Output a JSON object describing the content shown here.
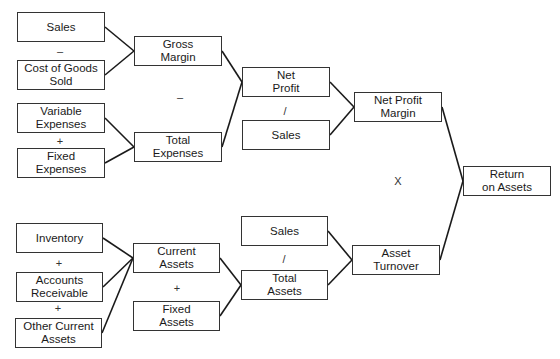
{
  "diagram": {
    "title": "",
    "nodes": {
      "sales_top": {
        "label": "Sales",
        "x": 17,
        "y": 12,
        "w": 88,
        "h": 30
      },
      "cogs": {
        "label": "Cost of Goods\nSold",
        "x": 17,
        "y": 60,
        "w": 88,
        "h": 30
      },
      "variable_expenses": {
        "label": "Variable\nExpenses",
        "x": 17,
        "y": 103,
        "w": 88,
        "h": 30
      },
      "fixed_expenses": {
        "label": "Fixed\nExpenses",
        "x": 17,
        "y": 148,
        "w": 88,
        "h": 30
      },
      "gross_margin": {
        "label": "Gross\nMargin",
        "x": 134,
        "y": 36,
        "w": 88,
        "h": 30
      },
      "total_expenses": {
        "label": "Total\nExpenses",
        "x": 134,
        "y": 132,
        "w": 88,
        "h": 30
      },
      "net_profit": {
        "label": "Net\nProfit",
        "x": 242,
        "y": 67,
        "w": 88,
        "h": 30
      },
      "sales_mid": {
        "label": "Sales",
        "x": 242,
        "y": 120,
        "w": 88,
        "h": 30
      },
      "net_profit_margin": {
        "label": "Net Profit\nMargin",
        "x": 354,
        "y": 92,
        "w": 88,
        "h": 30
      },
      "return_on_assets": {
        "label": "Return\non Assets",
        "x": 463,
        "y": 166,
        "w": 88,
        "h": 30
      },
      "inventory": {
        "label": "Inventory",
        "x": 16,
        "y": 223,
        "w": 87,
        "h": 30
      },
      "accounts_receivable": {
        "label": "Accounts\nReceivable",
        "x": 16,
        "y": 272,
        "w": 87,
        "h": 30
      },
      "other_current_assets": {
        "label": "Other Current\nAssets",
        "x": 15,
        "y": 318,
        "w": 87,
        "h": 30
      },
      "current_assets": {
        "label": "Current\nAssets",
        "x": 133,
        "y": 243,
        "w": 87,
        "h": 30
      },
      "fixed_assets": {
        "label": "Fixed\nAssets",
        "x": 133,
        "y": 301,
        "w": 87,
        "h": 30
      },
      "sales_bottom": {
        "label": "Sales",
        "x": 241,
        "y": 216,
        "w": 87,
        "h": 30
      },
      "total_assets": {
        "label": "Total\nAssets",
        "x": 241,
        "y": 270,
        "w": 87,
        "h": 30
      },
      "asset_turnover": {
        "label": "Asset\nTurnover",
        "x": 352,
        "y": 245,
        "w": 88,
        "h": 30
      }
    },
    "operators": {
      "sales_minus_cogs": {
        "symbol": "–",
        "x": 60,
        "y": 51
      },
      "variable_plus_fixed": {
        "symbol": "+",
        "x": 60,
        "y": 141
      },
      "gross_minus_total": {
        "symbol": "–",
        "x": 180,
        "y": 97
      },
      "net_profit_div_sales": {
        "symbol": "/",
        "x": 285,
        "y": 111
      },
      "margin_times_turnover": {
        "symbol": "X",
        "x": 398,
        "y": 181
      },
      "inventory_plus_ar": {
        "symbol": "+",
        "x": 59,
        "y": 263
      },
      "ar_plus_other": {
        "symbol": "+",
        "x": 58,
        "y": 308
      },
      "current_plus_fixed": {
        "symbol": "+",
        "x": 177,
        "y": 288
      },
      "sales_div_total_assets": {
        "symbol": "/",
        "x": 284,
        "y": 259
      }
    },
    "edges": [
      {
        "from": "sales_top",
        "to": "gross_margin",
        "x1": 105,
        "y1": 27,
        "x2": 134,
        "y2": 51
      },
      {
        "from": "cogs",
        "to": "gross_margin",
        "x1": 105,
        "y1": 75,
        "x2": 134,
        "y2": 51
      },
      {
        "from": "variable_expenses",
        "to": "total_expenses",
        "x1": 105,
        "y1": 118,
        "x2": 134,
        "y2": 147
      },
      {
        "from": "fixed_expenses",
        "to": "total_expenses",
        "x1": 105,
        "y1": 163,
        "x2": 134,
        "y2": 147
      },
      {
        "from": "gross_margin",
        "to": "net_profit",
        "x1": 222,
        "y1": 51,
        "x2": 242,
        "y2": 82
      },
      {
        "from": "total_expenses",
        "to": "net_profit",
        "x1": 222,
        "y1": 147,
        "x2": 242,
        "y2": 82
      },
      {
        "from": "net_profit",
        "to": "net_profit_margin",
        "x1": 330,
        "y1": 82,
        "x2": 354,
        "y2": 107
      },
      {
        "from": "sales_mid",
        "to": "net_profit_margin",
        "x1": 330,
        "y1": 135,
        "x2": 354,
        "y2": 107
      },
      {
        "from": "net_profit_margin",
        "to": "return_on_assets",
        "x1": 442,
        "y1": 107,
        "x2": 463,
        "y2": 181
      },
      {
        "from": "asset_turnover",
        "to": "return_on_assets",
        "x1": 440,
        "y1": 260,
        "x2": 463,
        "y2": 181
      },
      {
        "from": "inventory",
        "to": "current_assets",
        "x1": 103,
        "y1": 238,
        "x2": 133,
        "y2": 258
      },
      {
        "from": "accounts_receivable",
        "to": "current_assets",
        "x1": 103,
        "y1": 287,
        "x2": 133,
        "y2": 258
      },
      {
        "from": "other_current_assets",
        "to": "current_assets",
        "x1": 102,
        "y1": 333,
        "x2": 133,
        "y2": 258
      },
      {
        "from": "current_assets",
        "to": "total_assets",
        "x1": 220,
        "y1": 258,
        "x2": 241,
        "y2": 285
      },
      {
        "from": "fixed_assets",
        "to": "total_assets",
        "x1": 220,
        "y1": 316,
        "x2": 241,
        "y2": 285
      },
      {
        "from": "sales_bottom",
        "to": "asset_turnover",
        "x1": 328,
        "y1": 231,
        "x2": 352,
        "y2": 260
      },
      {
        "from": "total_assets",
        "to": "asset_turnover",
        "x1": 328,
        "y1": 285,
        "x2": 352,
        "y2": 260
      }
    ],
    "colors": {
      "line": "#1a1a1a",
      "box_border": "#333333",
      "background": "#ffffff"
    }
  }
}
